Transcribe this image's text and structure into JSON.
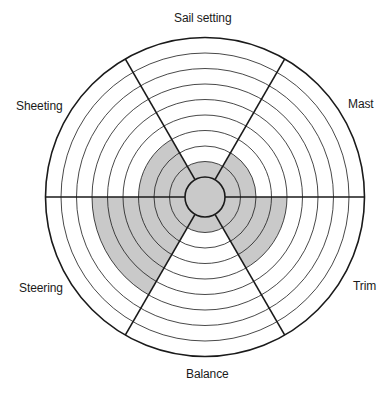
{
  "chart_data": {
    "type": "radial-wheel",
    "title": "",
    "center": [
      205,
      197
    ],
    "inner_radius": 20,
    "outer_radius": 159.5,
    "levels": 9,
    "fill_color": "#c9c9c9",
    "line_color": "#1a1a1a",
    "grid": true,
    "categories": [
      "Sail setting",
      "Mast",
      "Trim",
      "Balance",
      "Steering",
      "Sheeting"
    ],
    "values": [
      1,
      2,
      4,
      1,
      6,
      3
    ],
    "sectors": [
      {
        "label": "Sail setting",
        "value": 1,
        "start_deg": 240,
        "end_deg": 300
      },
      {
        "label": "Mast",
        "value": 2,
        "start_deg": 300,
        "end_deg": 360
      },
      {
        "label": "Trim",
        "value": 4,
        "start_deg": 0,
        "end_deg": 60
      },
      {
        "label": "Balance",
        "value": 1,
        "start_deg": 60,
        "end_deg": 120
      },
      {
        "label": "Steering",
        "value": 6,
        "start_deg": 120,
        "end_deg": 180
      },
      {
        "label": "Sheeting",
        "value": 3,
        "start_deg": 180,
        "end_deg": 240
      }
    ],
    "divider_angles_deg": [
      0,
      60,
      120,
      180,
      240,
      300
    ]
  },
  "labels": {
    "sail_setting": "Sail setting",
    "mast": "Mast",
    "trim": "Trim",
    "balance": "Balance",
    "steering": "Steering",
    "sheeting": "Sheeting"
  }
}
